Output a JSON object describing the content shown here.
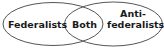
{
  "diagram": {
    "type": "venn",
    "stroke_color": "#555555",
    "text_color": "#1a1a1a",
    "sets": [
      {
        "label": "Federalists"
      },
      {
        "label": "Anti-\nfederalists",
        "line1": "Anti-",
        "line2": "federalists"
      }
    ],
    "intersection": {
      "label": "Both"
    }
  }
}
